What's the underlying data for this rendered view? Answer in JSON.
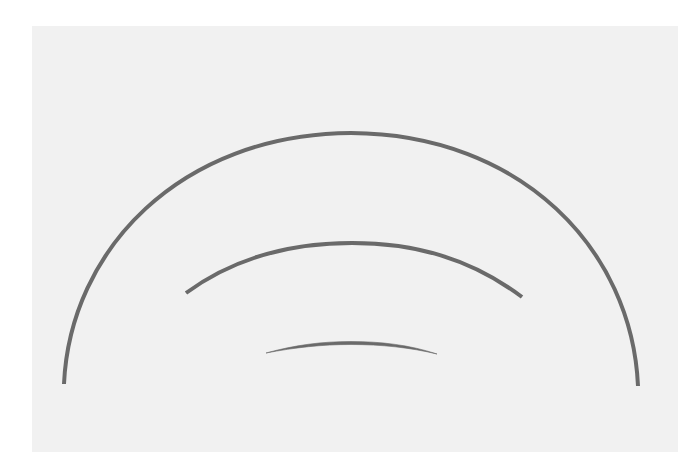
{
  "figure": {
    "background_color": "#ffffff",
    "panel_color": "#f1f1f1",
    "stroke_color": "#6a6a6a",
    "arcs": [
      {
        "name": "outer-arc",
        "start": [
          64,
          384
        ],
        "peak": [
          351,
          133
        ],
        "end": [
          638,
          386
        ],
        "stroke_width": 4
      },
      {
        "name": "middle-arc",
        "start": [
          185,
          293
        ],
        "peak": [
          352,
          243
        ],
        "end": [
          522,
          296
        ],
        "stroke_width": 4
      },
      {
        "name": "inner-arc",
        "start": [
          266,
          352
        ],
        "peak": [
          351,
          342
        ],
        "end": [
          437,
          354
        ],
        "stroke_width": 3
      }
    ]
  }
}
